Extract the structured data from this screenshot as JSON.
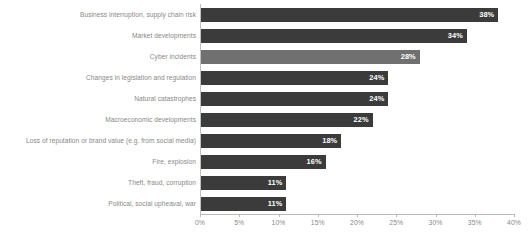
{
  "chart_data": {
    "type": "bar",
    "orientation": "horizontal",
    "title": "",
    "subtitle": "",
    "xlabel": "",
    "ylabel": "",
    "xlim": [
      0,
      40
    ],
    "grid": false,
    "legend": null,
    "value_suffix": "%",
    "axis_ticks": [
      "0%",
      "5%",
      "10%",
      "15%",
      "20%",
      "25%",
      "30%",
      "35%",
      "40%"
    ],
    "axis_tick_values": [
      0,
      5,
      10,
      15,
      20,
      25,
      30,
      35,
      40
    ],
    "categories": [
      "Business interruption, supply chain risk",
      "Market developments",
      "Cyber incidents",
      "Changes in legislation and regulation",
      "Natural catastrophes",
      "Macroeconomic developments",
      "Loss of reputation or brand value (e.g. from social media)",
      "Fire, explosion",
      "Theft, fraud, corruption",
      "Political, social upheaval, war"
    ],
    "values": [
      38,
      34,
      28,
      24,
      24,
      22,
      18,
      16,
      11,
      11
    ],
    "value_labels": [
      "38%",
      "34%",
      "28%",
      "24%",
      "24%",
      "22%",
      "18%",
      "16%",
      "11%",
      "11%"
    ],
    "bar_colors": [
      "#3b3b3b",
      "#3b3b3b",
      "#707070",
      "#3b3b3b",
      "#3b3b3b",
      "#3b3b3b",
      "#3b3b3b",
      "#3b3b3b",
      "#3b3b3b",
      "#3b3b3b"
    ],
    "colors": {
      "bar_default": "#3b3b3b",
      "bar_highlight": "#707070",
      "value_text": "#ffffff",
      "category_text": "#888888",
      "axis": "#b9b9b9",
      "tick_text": "#8a8a8a",
      "background": "#ffffff"
    }
  }
}
